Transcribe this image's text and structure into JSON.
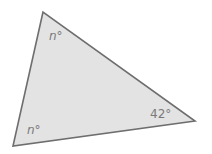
{
  "diagram": {
    "type": "triangle",
    "fill_color": "#e3e3e3",
    "stroke_color": "#6e6e6e",
    "vertices": {
      "top": [
        43,
        12
      ],
      "bottom_left": [
        13,
        146
      ],
      "right": [
        195,
        121
      ]
    },
    "angles": [
      {
        "vertex": "top",
        "var": "n",
        "unit": "°"
      },
      {
        "vertex": "bottom_left",
        "var": "n",
        "unit": "°"
      },
      {
        "vertex": "right",
        "value": "42",
        "unit": "°"
      }
    ]
  }
}
